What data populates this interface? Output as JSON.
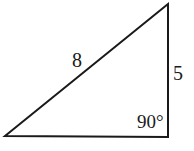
{
  "diagram": {
    "type": "right-triangle",
    "vertices": {
      "top": [
        168,
        4
      ],
      "bottom_left": [
        5,
        136
      ],
      "bottom_right": [
        168,
        137
      ]
    },
    "stroke_color": "#1a1a1a",
    "fill_color": "#ffffff",
    "labels": {
      "hypotenuse": "8",
      "vertical_side": "5",
      "right_angle": "90°"
    }
  }
}
